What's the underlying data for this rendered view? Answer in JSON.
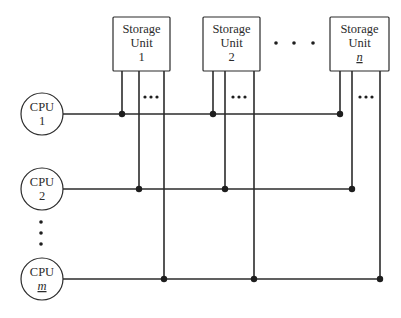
{
  "diagram": {
    "type": "multiprocessor crossbar / multiple-bus interconnection",
    "storage_units": [
      {
        "line1": "Storage",
        "line2": "Unit",
        "id": "1"
      },
      {
        "line1": "Storage",
        "line2": "Unit",
        "id": "2"
      },
      {
        "line1": "Storage",
        "line2": "Unit",
        "id": "n"
      }
    ],
    "cpus": [
      {
        "line1": "CPU",
        "id": "1"
      },
      {
        "line1": "CPU",
        "id": "2"
      },
      {
        "line1": "CPU",
        "id": "m"
      }
    ],
    "ellipsis": {
      "between_storage_units": "• • •",
      "between_bus_lines": "•••",
      "between_cpus": "vertical dots"
    },
    "connections": [
      {
        "cpu": "1",
        "storage": [
          "1",
          "2",
          "n"
        ]
      },
      {
        "cpu": "2",
        "storage": [
          "1",
          "2",
          "n"
        ]
      },
      {
        "cpu": "m",
        "storage": [
          "1",
          "2",
          "n"
        ]
      }
    ],
    "colors": {
      "line": "#2b2b2b",
      "background": "#ffffff"
    }
  }
}
